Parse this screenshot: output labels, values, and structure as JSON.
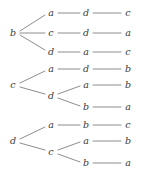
{
  "figure": {
    "width": 143,
    "height": 174,
    "background_color": "#ffffff",
    "edge_color": "#8e8e8e",
    "label_color": "#3a3a3a"
  },
  "chart_data": {
    "type": "diagram",
    "diagram_kind": "tree",
    "alphabet": [
      "a",
      "b",
      "c",
      "d"
    ],
    "trees": [
      {
        "root": "b",
        "paths": [
          [
            "a",
            "d",
            "c"
          ],
          [
            "c",
            "d",
            "a"
          ],
          [
            "d",
            "a",
            "c"
          ]
        ]
      },
      {
        "root": "c",
        "paths": [
          [
            "a",
            "d",
            "b"
          ],
          [
            "d",
            "a",
            "b"
          ],
          [
            "d",
            "b",
            "a"
          ]
        ]
      },
      {
        "root": "d",
        "paths": [
          [
            "a",
            "b",
            "c"
          ],
          [
            "c",
            "a",
            "b"
          ],
          [
            "c",
            "b",
            "a"
          ]
        ]
      }
    ]
  },
  "nodes": [
    {
      "id": "t1-root",
      "text": "b",
      "x": 13,
      "y": 33
    },
    {
      "id": "t1-l1-r1",
      "text": "a",
      "x": 51,
      "y": 13
    },
    {
      "id": "t1-l1-r2",
      "text": "c",
      "x": 51,
      "y": 33
    },
    {
      "id": "t1-l1-r3",
      "text": "d",
      "x": 51,
      "y": 52
    },
    {
      "id": "t1-l2-r1",
      "text": "d",
      "x": 86,
      "y": 13
    },
    {
      "id": "t1-l2-r2",
      "text": "d",
      "x": 86,
      "y": 33
    },
    {
      "id": "t1-l2-r3",
      "text": "a",
      "x": 86,
      "y": 52
    },
    {
      "id": "t1-l3-r1",
      "text": "c",
      "x": 128,
      "y": 13
    },
    {
      "id": "t1-l3-r2",
      "text": "a",
      "x": 128,
      "y": 33
    },
    {
      "id": "t1-l3-r3",
      "text": "c",
      "x": 128,
      "y": 52
    },
    {
      "id": "t2-root",
      "text": "c",
      "x": 13,
      "y": 85
    },
    {
      "id": "t2-l1-r1",
      "text": "a",
      "x": 51,
      "y": 69
    },
    {
      "id": "t2-l1-r2",
      "text": "d",
      "x": 51,
      "y": 96
    },
    {
      "id": "t2-l2-r1",
      "text": "d",
      "x": 86,
      "y": 69
    },
    {
      "id": "t2-l2-r2",
      "text": "a",
      "x": 86,
      "y": 85
    },
    {
      "id": "t2-l2-r3",
      "text": "b",
      "x": 86,
      "y": 107
    },
    {
      "id": "t2-l3-r1",
      "text": "b",
      "x": 128,
      "y": 69
    },
    {
      "id": "t2-l3-r2",
      "text": "b",
      "x": 128,
      "y": 85
    },
    {
      "id": "t2-l3-r3",
      "text": "a",
      "x": 128,
      "y": 107
    },
    {
      "id": "t3-root",
      "text": "d",
      "x": 13,
      "y": 141
    },
    {
      "id": "t3-l1-r1",
      "text": "a",
      "x": 51,
      "y": 125
    },
    {
      "id": "t3-l1-r2",
      "text": "c",
      "x": 51,
      "y": 152
    },
    {
      "id": "t3-l2-r1",
      "text": "b",
      "x": 86,
      "y": 125
    },
    {
      "id": "t3-l2-r2",
      "text": "a",
      "x": 86,
      "y": 141
    },
    {
      "id": "t3-l2-r3",
      "text": "b",
      "x": 86,
      "y": 163
    },
    {
      "id": "t3-l3-r1",
      "text": "c",
      "x": 128,
      "y": 125
    },
    {
      "id": "t3-l3-r2",
      "text": "b",
      "x": 128,
      "y": 141
    },
    {
      "id": "t3-l3-r3",
      "text": "a",
      "x": 128,
      "y": 163
    }
  ],
  "edges": [
    {
      "id": "t1-e1",
      "x1": 20,
      "y1": 31,
      "x2": 45,
      "y2": 15
    },
    {
      "id": "t1-e2",
      "x1": 20,
      "y1": 33,
      "x2": 45,
      "y2": 33
    },
    {
      "id": "t1-e3",
      "x1": 20,
      "y1": 35,
      "x2": 45,
      "y2": 50
    },
    {
      "id": "t1-e4",
      "x1": 58,
      "y1": 13,
      "x2": 80,
      "y2": 13
    },
    {
      "id": "t1-e5",
      "x1": 58,
      "y1": 33,
      "x2": 80,
      "y2": 33
    },
    {
      "id": "t1-e6",
      "x1": 58,
      "y1": 52,
      "x2": 80,
      "y2": 52
    },
    {
      "id": "t1-e7",
      "x1": 93,
      "y1": 13,
      "x2": 121,
      "y2": 13
    },
    {
      "id": "t1-e8",
      "x1": 93,
      "y1": 33,
      "x2": 121,
      "y2": 33
    },
    {
      "id": "t1-e9",
      "x1": 93,
      "y1": 52,
      "x2": 121,
      "y2": 52
    },
    {
      "id": "t2-e1",
      "x1": 20,
      "y1": 83,
      "x2": 45,
      "y2": 71
    },
    {
      "id": "t2-e2",
      "x1": 20,
      "y1": 87,
      "x2": 45,
      "y2": 94
    },
    {
      "id": "t2-e3",
      "x1": 58,
      "y1": 69,
      "x2": 80,
      "y2": 69
    },
    {
      "id": "t2-e4",
      "x1": 58,
      "y1": 94,
      "x2": 80,
      "y2": 86
    },
    {
      "id": "t2-e5",
      "x1": 58,
      "y1": 98,
      "x2": 80,
      "y2": 106
    },
    {
      "id": "t2-e6",
      "x1": 93,
      "y1": 69,
      "x2": 121,
      "y2": 69
    },
    {
      "id": "t2-e7",
      "x1": 93,
      "y1": 85,
      "x2": 121,
      "y2": 85
    },
    {
      "id": "t2-e8",
      "x1": 93,
      "y1": 107,
      "x2": 121,
      "y2": 107
    },
    {
      "id": "t3-e1",
      "x1": 20,
      "y1": 139,
      "x2": 45,
      "y2": 127
    },
    {
      "id": "t3-e2",
      "x1": 20,
      "y1": 143,
      "x2": 45,
      "y2": 150
    },
    {
      "id": "t3-e3",
      "x1": 58,
      "y1": 125,
      "x2": 80,
      "y2": 125
    },
    {
      "id": "t3-e4",
      "x1": 58,
      "y1": 150,
      "x2": 80,
      "y2": 142
    },
    {
      "id": "t3-e5",
      "x1": 58,
      "y1": 154,
      "x2": 80,
      "y2": 162
    },
    {
      "id": "t3-e6",
      "x1": 93,
      "y1": 125,
      "x2": 121,
      "y2": 125
    },
    {
      "id": "t3-e7",
      "x1": 93,
      "y1": 141,
      "x2": 121,
      "y2": 141
    },
    {
      "id": "t3-e8",
      "x1": 93,
      "y1": 163,
      "x2": 121,
      "y2": 163
    }
  ]
}
